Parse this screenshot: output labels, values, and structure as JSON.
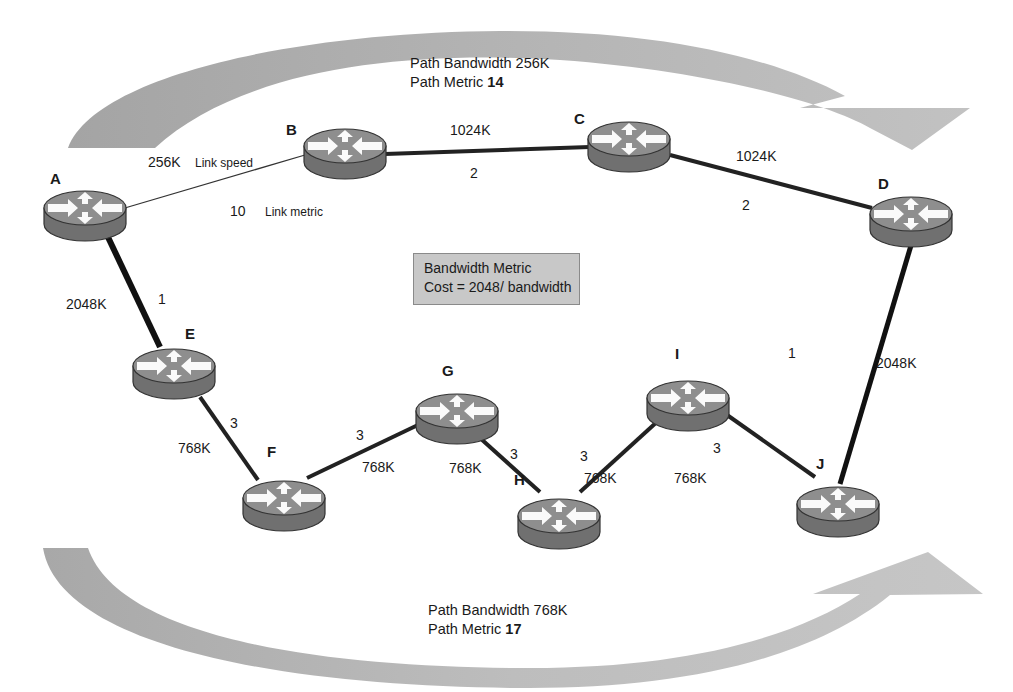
{
  "top_path": {
    "bandwidth_label": "Path Bandwidth 256K",
    "metric_prefix": "Path Metric ",
    "metric_value": "14"
  },
  "bottom_path": {
    "bandwidth_label": "Path Bandwidth 768K",
    "metric_prefix": "Path Metric ",
    "metric_value": "17"
  },
  "legend": {
    "line1": "Bandwidth Metric",
    "line2": "Cost = 2048/ bandwidth"
  },
  "annotations": {
    "link_speed": "Link speed",
    "link_metric": "Link metric"
  },
  "colors": {
    "arrow_gray": "#a9a9a9",
    "router_top": "#8c8c8c",
    "router_side": "#6e6e6e",
    "legend_bg": "#c8c8c8"
  },
  "nodes": [
    {
      "id": "A",
      "label": "A"
    },
    {
      "id": "B",
      "label": "B"
    },
    {
      "id": "C",
      "label": "C"
    },
    {
      "id": "D",
      "label": "D"
    },
    {
      "id": "E",
      "label": "E"
    },
    {
      "id": "F",
      "label": "F"
    },
    {
      "id": "G",
      "label": "G"
    },
    {
      "id": "H",
      "label": "H"
    },
    {
      "id": "I",
      "label": "I"
    },
    {
      "id": "J",
      "label": "J"
    }
  ],
  "links": [
    {
      "from": "A",
      "to": "B",
      "speed": "256K",
      "metric": "10"
    },
    {
      "from": "B",
      "to": "C",
      "speed": "1024K",
      "metric": "2"
    },
    {
      "from": "C",
      "to": "D",
      "speed": "1024K",
      "metric": "2"
    },
    {
      "from": "A",
      "to": "E",
      "speed": "2048K",
      "metric": "1"
    },
    {
      "from": "E",
      "to": "F",
      "speed": "768K",
      "metric": "3"
    },
    {
      "from": "F",
      "to": "G",
      "speed": "768K",
      "metric": "3"
    },
    {
      "from": "G",
      "to": "H",
      "speed": "768K",
      "metric": "3"
    },
    {
      "from": "H",
      "to": "I",
      "speed": "768K",
      "metric": "3"
    },
    {
      "from": "I",
      "to": "J",
      "speed": "768K",
      "metric": "3"
    },
    {
      "from": "D",
      "to": "J",
      "speed": "2048K",
      "metric": "1"
    }
  ]
}
